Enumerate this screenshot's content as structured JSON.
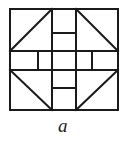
{
  "figure": {
    "caption": "a",
    "title": "a",
    "kind": "quilt-block-diagram",
    "colors": {
      "line": "#1a1a1a",
      "background": "#ffffff",
      "fill": "#ffffff"
    },
    "stroke_width": 2,
    "frame": {
      "left": 10,
      "top": 9,
      "right": 118,
      "bottom": 110,
      "width": 108,
      "height": 101
    },
    "grid": {
      "vertical_guides": [
        10,
        52,
        76,
        118
      ],
      "horizontal_guides": [
        9,
        51,
        70,
        110
      ],
      "middle_band_dividers_x": [
        38,
        52,
        76,
        92
      ],
      "top_center_divider_y": 33,
      "bottom_center_divider_y": 88
    },
    "corner_triangles": [
      {
        "name": "top-left",
        "diagonal": "bottom-left-to-top-right"
      },
      {
        "name": "top-right",
        "diagonal": "top-left-to-bottom-right"
      },
      {
        "name": "bottom-left",
        "diagonal": "top-left-to-bottom-right"
      },
      {
        "name": "bottom-right",
        "diagonal": "bottom-left-to-top-right"
      }
    ],
    "middle_band_cells": 4,
    "center_column_cells": 2
  }
}
